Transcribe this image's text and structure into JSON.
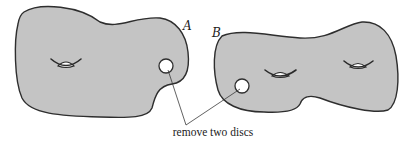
{
  "diagram": {
    "surfaces": [
      {
        "id": "A",
        "label": "A",
        "genus": 1,
        "disc_removed": true
      },
      {
        "id": "B",
        "label": "B",
        "genus": 2,
        "disc_removed": true
      }
    ],
    "caption": "remove two discs",
    "colors": {
      "surface_fill": "#c4c4c4",
      "outline": "#2e2e2e",
      "background": "#ffffff"
    }
  }
}
